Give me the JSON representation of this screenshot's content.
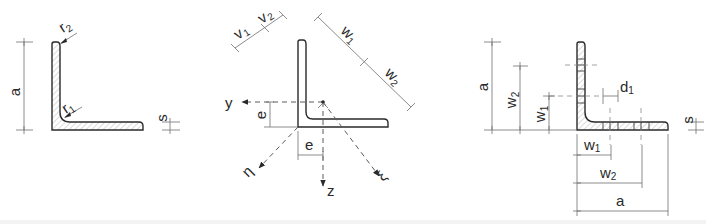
{
  "figure": {
    "colors": {
      "line": "#2a2a2a",
      "dimension": "#6e6e6e",
      "hatch": "#b8b8b8",
      "background": "#ffffff"
    },
    "panels": [
      {
        "id": "geometry",
        "labels": {
          "a": "a",
          "r2": "r",
          "r2_sub": "2",
          "r1": "r",
          "r1_sub": "1",
          "s": "s"
        }
      },
      {
        "id": "axes",
        "labels": {
          "v1": "v",
          "v1_sub": "1",
          "v2": "v",
          "v2_sub": "2",
          "w1": "w",
          "w1_sub": "1",
          "w2": "w",
          "w2_sub": "2",
          "y": "y",
          "z": "z",
          "e_vertical": "e",
          "e_horizontal": "e",
          "eta": "η",
          "xi": "ξ"
        }
      },
      {
        "id": "hole-gauges",
        "labels": {
          "a_vertical": "a",
          "w2_vertical": "w",
          "w2_vertical_sub": "2",
          "w1_vertical": "w",
          "w1_vertical_sub": "1",
          "d1": "d",
          "d1_sub": "1",
          "s": "s",
          "w1_horizontal": "w",
          "w1_horizontal_sub": "1",
          "w2_horizontal": "w",
          "w2_horizontal_sub": "2",
          "a_horizontal": "a"
        }
      }
    ]
  }
}
